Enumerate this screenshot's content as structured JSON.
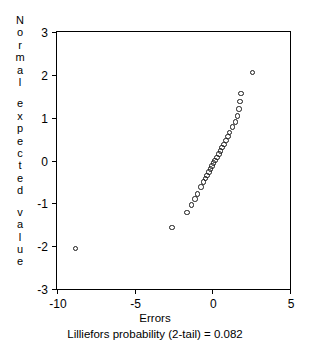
{
  "chart_data": {
    "type": "scatter",
    "title": "",
    "xlabel": "Errors",
    "ylabel": "Normal expected value",
    "annotation": "Lilliefors probability (2-tail) = 0.082",
    "xlim": [
      -10,
      5
    ],
    "ylim": [
      -3,
      3
    ],
    "xticks": [
      -10,
      -5,
      0,
      5
    ],
    "xtick_labels": [
      "-10",
      "-5",
      "0",
      "5"
    ],
    "yticks": [
      -3,
      -2,
      -1,
      0,
      1,
      2,
      3
    ],
    "ytick_labels": [
      "-3",
      "-2",
      "-1",
      "0",
      "1",
      "2",
      "3"
    ],
    "grid": false,
    "legend": false,
    "marker": "open-circle",
    "series": [
      {
        "name": "normal probability plot",
        "points": [
          [
            -8.8,
            -2.05
          ],
          [
            -2.6,
            -1.56
          ],
          [
            -1.62,
            -1.21
          ],
          [
            -1.35,
            -1.04
          ],
          [
            -1.12,
            -0.9
          ],
          [
            -0.95,
            -0.78
          ],
          [
            -0.72,
            -0.62
          ],
          [
            -0.58,
            -0.5
          ],
          [
            -0.45,
            -0.42
          ],
          [
            -0.34,
            -0.35
          ],
          [
            -0.22,
            -0.27
          ],
          [
            -0.12,
            -0.2
          ],
          [
            -0.02,
            -0.13
          ],
          [
            0.08,
            -0.06
          ],
          [
            0.18,
            0.0
          ],
          [
            0.3,
            0.07
          ],
          [
            0.42,
            0.15
          ],
          [
            0.52,
            0.22
          ],
          [
            0.62,
            0.3
          ],
          [
            0.75,
            0.38
          ],
          [
            0.88,
            0.47
          ],
          [
            1.0,
            0.56
          ],
          [
            1.12,
            0.66
          ],
          [
            1.3,
            0.78
          ],
          [
            1.5,
            0.9
          ],
          [
            1.62,
            1.04
          ],
          [
            1.72,
            1.2
          ],
          [
            1.78,
            1.38
          ],
          [
            1.85,
            1.56
          ],
          [
            2.6,
            2.05
          ]
        ]
      }
    ]
  },
  "ylabel_words": [
    "Normal",
    "expected",
    "value"
  ]
}
